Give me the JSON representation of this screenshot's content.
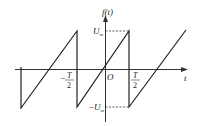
{
  "diagram": {
    "y_axis_label": "f(t)",
    "x_axis_label": "t",
    "origin_label": "O",
    "u_max_label": "U",
    "u_max_sub": "m",
    "neg_u_max_prefix": "−U",
    "neg_u_max_sub": "m",
    "half_period_pos": {
      "num": "T",
      "den": "2"
    },
    "half_period_neg": {
      "sign": "−",
      "num": "T",
      "den": "2"
    },
    "line_color": "#222222"
  }
}
